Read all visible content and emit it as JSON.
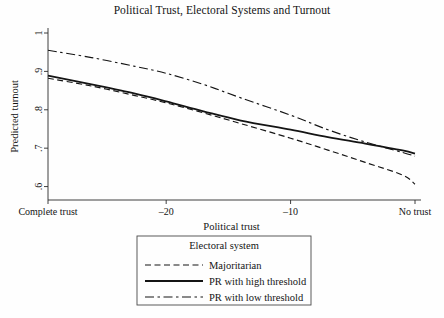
{
  "chart_data": {
    "type": "line",
    "title": "Political Trust, Electoral Systems and Turnout",
    "xlabel": "Political trust",
    "ylabel": "Predicted turnout",
    "xlim": [
      -29.5,
      0
    ],
    "ylim": [
      0.565,
      1.0
    ],
    "grid": false,
    "x_ticks": [
      {
        "value": -29.5,
        "label": "Complete trust"
      },
      {
        "value": -20,
        "label": "–20"
      },
      {
        "value": -10,
        "label": "–10"
      },
      {
        "value": 0,
        "label": "No trust"
      }
    ],
    "y_ticks": [
      {
        "value": 1.0,
        "label": "1"
      },
      {
        "value": 0.9,
        "label": ".9"
      },
      {
        "value": 0.8,
        "label": ".8"
      },
      {
        "value": 0.7,
        "label": ".7"
      },
      {
        "value": 0.6,
        "label": ".6"
      }
    ],
    "legend": {
      "title": "Electoral system",
      "position": "below-plot-center",
      "entries": [
        {
          "name": "Majoritarian",
          "style": "dashed"
        },
        {
          "name": "PR with high threshold",
          "style": "solid"
        },
        {
          "name": "PR with low threshold",
          "style": "dash-dot"
        }
      ]
    },
    "series": [
      {
        "name": "Majoritarian",
        "style": "dashed",
        "color": "#141414",
        "x": [
          -29.5,
          -26,
          -22.5,
          -20,
          -17,
          -14,
          -10,
          -7,
          -4,
          -1,
          0
        ],
        "y": [
          0.882,
          0.862,
          0.837,
          0.818,
          0.792,
          0.764,
          0.726,
          0.695,
          0.663,
          0.63,
          0.606
        ]
      },
      {
        "name": "PR with high threshold",
        "style": "solid",
        "color": "#141414",
        "x": [
          -29.5,
          -26,
          -22.5,
          -20,
          -17,
          -14,
          -10,
          -7,
          -4,
          -1,
          0
        ],
        "y": [
          0.889,
          0.866,
          0.842,
          0.822,
          0.796,
          0.772,
          0.748,
          0.729,
          0.712,
          0.694,
          0.686
        ]
      },
      {
        "name": "PR with low threshold",
        "style": "dash-dot",
        "color": "#141414",
        "x": [
          -29.5,
          -26,
          -22.5,
          -20,
          -17,
          -14,
          -10,
          -7,
          -4,
          -1,
          0
        ],
        "y": [
          0.955,
          0.936,
          0.913,
          0.895,
          0.866,
          0.831,
          0.786,
          0.748,
          0.716,
          0.689,
          0.679
        ]
      }
    ]
  }
}
